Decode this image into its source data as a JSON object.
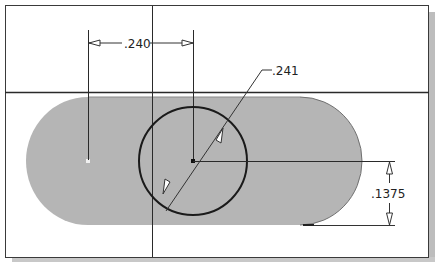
{
  "sketch": {
    "colors": {
      "background": "#ffffff",
      "frame": "#3a3a3a",
      "frame_shadow": "#b8b8b8",
      "profile_fill": "#b5b5b5",
      "profile_edge": "#6e6e6e",
      "construction_line": "#2a2a2a",
      "circle": "#1a1a1a",
      "dimension": "#333333"
    },
    "dimensions": {
      "horizontal_distance": {
        "label": ".240"
      },
      "circle_diameter": {
        "label": ".241"
      },
      "vertical_radius": {
        "label": ".1375"
      }
    },
    "geometry": {
      "slot": {
        "shape": "obround",
        "fill": "gray"
      },
      "circle": {
        "center": [
          193,
          161
        ],
        "radius": 54
      },
      "horizontal_reference_line_y": 92,
      "vertical_reference_line_x": 152
    }
  }
}
